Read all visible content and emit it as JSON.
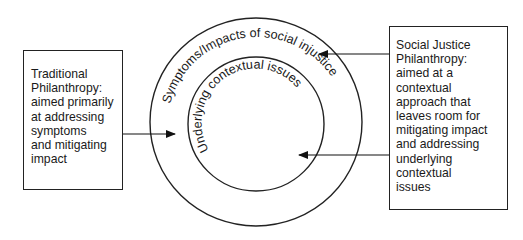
{
  "diagram": {
    "outer_circle": {
      "label": "Symptoms/Impacts of social injustice"
    },
    "inner_circle": {
      "label": "Underlying contextual issues"
    },
    "left_box": {
      "lines": [
        "Traditional",
        "Philanthropy:",
        "aimed primarily",
        "at addressing",
        "symptoms",
        "and mitigating",
        "impact"
      ],
      "arrow_target": "outer_circle"
    },
    "right_box": {
      "lines": [
        "Social Justice",
        "Philanthropy:",
        "aimed at a",
        "contextual",
        "approach that",
        "leaves room for",
        "mitigating impact",
        "and addressing",
        "underlying",
        "contextual",
        "issues"
      ],
      "arrow_targets": [
        "outer_circle",
        "inner_circle"
      ]
    },
    "colors": {
      "stroke": "#222222",
      "text": "#1a1a1a",
      "background": "#ffffff"
    }
  }
}
